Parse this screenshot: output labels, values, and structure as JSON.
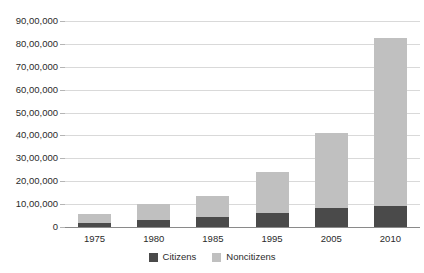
{
  "chart_data": {
    "type": "bar",
    "subtype": "stacked-vertical",
    "title": "",
    "subtitle": "",
    "xlabel": "",
    "ylabel": "",
    "categories": [
      "1975",
      "1980",
      "1985",
      "1995",
      "2005",
      "2010"
    ],
    "series": [
      {
        "name": "Citizens",
        "color": "#4a4a4a",
        "values": [
          180000,
          300000,
          430000,
          600000,
          830000,
          930000
        ]
      },
      {
        "name": "Noncitizens",
        "color": "#c0c0c0",
        "values": [
          390000,
          700000,
          920000,
          1800000,
          3270000,
          7320000
        ]
      }
    ],
    "totals": [
      570000,
      1000000,
      1350000,
      2400000,
      4100000,
      8250000
    ],
    "ylim": [
      0,
      9000000
    ],
    "ytick_step": 1000000,
    "ytick_labels": [
      "90,00,000",
      "80,00,000",
      "70,00,000",
      "60,00,000",
      "50,00,000",
      "40,00,000",
      "30,00,000",
      "20,00,000",
      "10,00,000",
      "0"
    ],
    "ytick_values": [
      9000000,
      8000000,
      7000000,
      6000000,
      5000000,
      4000000,
      3000000,
      2000000,
      1000000,
      0
    ],
    "grid": true,
    "grid_axis": "y",
    "legend_position": "bottom",
    "legend": [
      {
        "label": "Citizens",
        "color": "#4a4a4a"
      },
      {
        "label": "Noncitizens",
        "color": "#c0c0c0"
      }
    ],
    "number_format": "indian"
  },
  "colors": {
    "citizens": "#4a4a4a",
    "noncitizens": "#c0c0c0",
    "gridline": "#d9d9d9",
    "axis": "#8a8a8a",
    "text": "#2b2b2b",
    "background": "#ffffff"
  }
}
